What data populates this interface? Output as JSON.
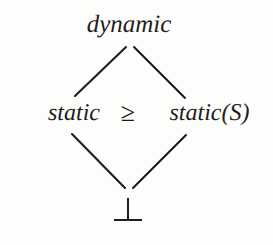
{
  "figure": {
    "type": "hasse-lattice-diagram",
    "background_color": "#fdfdfc",
    "ink_color": "#1d1d1d"
  },
  "nodes": {
    "top": "dynamic",
    "left": "static",
    "right": "static(S)",
    "bottom": "⊥"
  },
  "relation": {
    "symbol": "≥",
    "name": "greater-than-or-equal"
  },
  "edges": [
    {
      "name": "static-to-dynamic",
      "from": "static",
      "to": "dynamic",
      "x1": 75,
      "y1": 96,
      "x2": 126,
      "y2": 47
    },
    {
      "name": "staticS-to-dynamic",
      "from": "static(S)",
      "to": "dynamic",
      "x1": 134,
      "y1": 47,
      "x2": 185,
      "y2": 98
    },
    {
      "name": "bottom-to-static",
      "from": "⊥",
      "to": "static",
      "x1": 72,
      "y1": 134,
      "x2": 125,
      "y2": 188
    },
    {
      "name": "bottom-to-staticS",
      "from": "⊥",
      "to": "static(S)",
      "x1": 186,
      "y1": 135,
      "x2": 133,
      "y2": 188
    }
  ]
}
